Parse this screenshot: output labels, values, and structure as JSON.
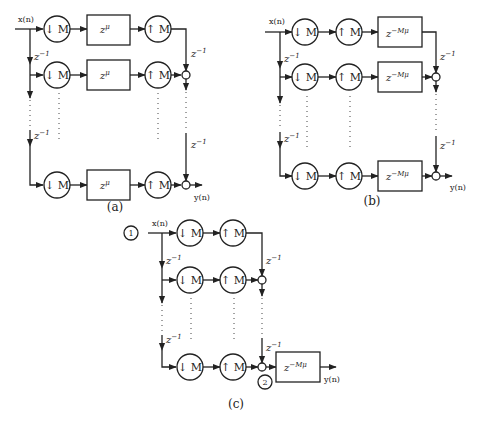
{
  "figure": {
    "panels": [
      {
        "id": "a",
        "caption": "(a)",
        "input_label": "x(n)",
        "output_label": "y(n)",
        "downsampler_label": "↓ M",
        "upsampler_label": "↑ M",
        "delay_label_base": "z",
        "delay_label_exp": "−1",
        "block_label_base": "z",
        "block_label_exp": "μ",
        "order": [
          "downsampler",
          "block",
          "upsampler"
        ]
      },
      {
        "id": "b",
        "caption": "(b)",
        "input_label": "x(n)",
        "output_label": "y(n)",
        "downsampler_label": "↓ M",
        "upsampler_label": "↑ M",
        "delay_label_base": "z",
        "delay_label_exp": "−1",
        "block_label_base": "z",
        "block_label_exp": "−Mμ",
        "order": [
          "downsampler",
          "upsampler",
          "block"
        ]
      },
      {
        "id": "c",
        "caption": "(c)",
        "input_label": "x(n)",
        "output_label": "y(n)",
        "downsampler_label": "↓ M",
        "upsampler_label": "↑ M",
        "delay_label_base": "z",
        "delay_label_exp": "−1",
        "block_label_base": "z",
        "block_label_exp": "−Mμ",
        "node_1_label": "1",
        "node_2_label": "2",
        "order": [
          "downsampler",
          "upsampler",
          "sum",
          "block"
        ]
      }
    ]
  }
}
